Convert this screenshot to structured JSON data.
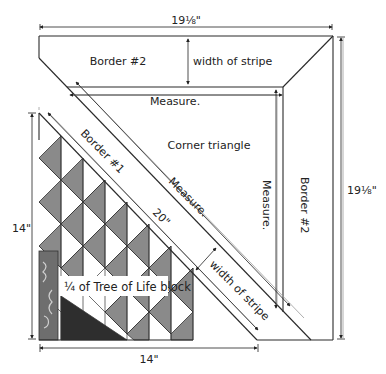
{
  "labels": {
    "top_dimension": "19⅛\"",
    "right_dimension": "19⅛\"",
    "left_dimension": "14\"",
    "bottom_dimension": "14\"",
    "diagonal_dimension": "20\"",
    "border2_top": "Border #2",
    "border2_right": "Border #2",
    "border1": "Border #1",
    "width_of_stripe_top": "width of stripe",
    "width_of_stripe_diag": "width of stripe",
    "measure_top": "Measure.",
    "measure_right": "Measure.",
    "measure_diag": "Measure.",
    "corner_triangle": "Corner triangle",
    "block_label": "¼ of Tree of Life block"
  },
  "colors": {
    "line": "#2a2a2a",
    "guide": "#9a9a9a",
    "triangle_gray": "#8a8a8a",
    "dark": "#2e2e2e",
    "fabric": "#6e6e6e"
  }
}
